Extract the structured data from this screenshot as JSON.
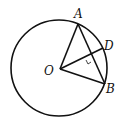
{
  "diagram": {
    "type": "circle-geometry",
    "stroke_color": "#111111",
    "background": "#ffffff",
    "circle": {
      "center": "O",
      "cx": 59,
      "cy": 68,
      "r": 48
    },
    "points": {
      "O": {
        "label": "O",
        "x": 60,
        "y": 69
      },
      "A": {
        "label": "A",
        "x": 78,
        "y": 24
      },
      "B": {
        "label": "B",
        "x": 105,
        "y": 84
      },
      "D": {
        "label": "D",
        "x": 103,
        "y": 48
      }
    },
    "segments": [
      {
        "from": "O",
        "to": "A"
      },
      {
        "from": "O",
        "to": "B"
      },
      {
        "from": "A",
        "to": "B"
      },
      {
        "from": "O",
        "to": "D"
      }
    ],
    "marks": [
      {
        "type": "right-angle",
        "at": "intersection of OD and AB"
      }
    ]
  }
}
